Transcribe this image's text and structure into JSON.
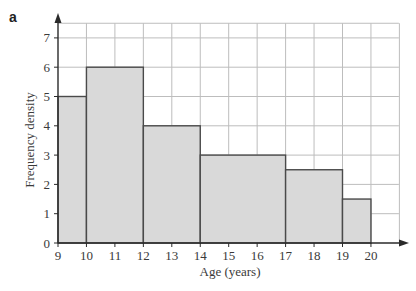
{
  "panel_label": "a",
  "chart_data": {
    "type": "bar",
    "subtype": "histogram",
    "title": "",
    "xlabel": "Age (years)",
    "ylabel": "Frequency density",
    "xlim": [
      9,
      21
    ],
    "ylim": [
      0,
      7.5
    ],
    "x_ticks": [
      9,
      10,
      11,
      12,
      13,
      14,
      15,
      16,
      17,
      18,
      19,
      20
    ],
    "y_ticks": [
      0,
      1,
      2,
      3,
      4,
      5,
      6,
      7
    ],
    "grid": true,
    "legend": null,
    "bins": [
      {
        "start": 9,
        "end": 10,
        "value": 5
      },
      {
        "start": 10,
        "end": 12,
        "value": 6
      },
      {
        "start": 12,
        "end": 14,
        "value": 4
      },
      {
        "start": 14,
        "end": 17,
        "value": 3
      },
      {
        "start": 17,
        "end": 19,
        "value": 2.5
      },
      {
        "start": 19,
        "end": 20,
        "value": 1.5
      }
    ],
    "categories": [
      "9-10",
      "10-12",
      "12-14",
      "14-17",
      "17-19",
      "19-20"
    ],
    "values": [
      5,
      6,
      4,
      3,
      2.5,
      1.5
    ]
  },
  "colors": {
    "bar_fill": "#d9d9d9",
    "bar_stroke": "#4a4a4a",
    "grid": "#bdbdbd",
    "axis": "#2a2a2a"
  }
}
